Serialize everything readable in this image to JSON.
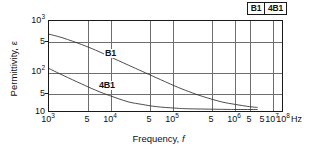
{
  "chart_data": {
    "type": "line",
    "title": "",
    "xlabel": "Frequency, f",
    "ylabel": "Permittivity, ε",
    "xunit": "Hz",
    "xscale": "log",
    "yscale": "log",
    "xlim": [
      1000,
      100000000
    ],
    "ylim": [
      10,
      1000
    ],
    "grid": true,
    "legend_position": "top-right",
    "xticks": [
      {
        "value": 1000,
        "label": "10",
        "exp": "3"
      },
      {
        "value": 5000,
        "label": "5",
        "exp": ""
      },
      {
        "value": 10000,
        "label": "10",
        "exp": "4"
      },
      {
        "value": 50000,
        "label": "5",
        "exp": ""
      },
      {
        "value": 100000,
        "label": "10",
        "exp": "5"
      },
      {
        "value": 500000,
        "label": "5",
        "exp": ""
      },
      {
        "value": 1000000,
        "label": "10",
        "exp": "6"
      },
      {
        "value": 5000000,
        "label": "5",
        "exp": ""
      },
      {
        "value": 10000000,
        "label": "10",
        "exp": "7"
      },
      {
        "value": 50000000,
        "label": "5",
        "exp": ""
      },
      {
        "value": 100000000,
        "label": "10",
        "exp": "8"
      }
    ],
    "yticks": [
      {
        "value": 1000,
        "label": "10",
        "exp": "3"
      },
      {
        "value": 500,
        "label": "5",
        "exp": ""
      },
      {
        "value": 100,
        "label": "10",
        "exp": "2"
      },
      {
        "value": 50,
        "label": "5",
        "exp": ""
      },
      {
        "value": 10,
        "label": "10",
        "exp": ""
      }
    ],
    "series": [
      {
        "name": "B1",
        "label_in_plot": "B1",
        "points": [
          [
            1000,
            510
          ],
          [
            2000,
            420
          ],
          [
            5000,
            300
          ],
          [
            10000,
            225
          ],
          [
            20000,
            162
          ],
          [
            50000,
            105
          ],
          [
            100000,
            76
          ],
          [
            200000,
            55
          ],
          [
            500000,
            36
          ],
          [
            1000000,
            27
          ],
          [
            2000000,
            21
          ],
          [
            5000000,
            16
          ],
          [
            10000000,
            14
          ],
          [
            20000000,
            12.5
          ],
          [
            30000000,
            12
          ]
        ]
      },
      {
        "name": "4B1",
        "label_in_plot": "4B1",
        "points": [
          [
            1000,
            88
          ],
          [
            2000,
            62
          ],
          [
            5000,
            40
          ],
          [
            10000,
            29
          ],
          [
            20000,
            22
          ],
          [
            50000,
            16
          ],
          [
            100000,
            14
          ],
          [
            200000,
            12.5
          ],
          [
            500000,
            11.6
          ],
          [
            1000000,
            11.2
          ],
          [
            5000000,
            10.9
          ],
          [
            10000000,
            10.8
          ],
          [
            30000000,
            10.8
          ]
        ]
      }
    ]
  },
  "legend": {
    "items": [
      {
        "label": "B1"
      },
      {
        "label": "4B1"
      }
    ]
  },
  "axes": {
    "x_title_text": "Frequency,",
    "x_title_symbol": "f",
    "y_title": "Permittivity, ε",
    "x_unit": "Hz"
  },
  "colors": {
    "frame": "#1a1a1a",
    "grid": "#6e6e6e",
    "curve": "#2b2b2b",
    "background": "#ffffff"
  }
}
